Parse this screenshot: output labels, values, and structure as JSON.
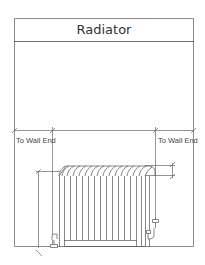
{
  "diagram": {
    "title": "Radiator",
    "labels": {
      "left_clearance": "To Wall End",
      "right_clearance": "To Wall End"
    },
    "colors": {
      "frame": "#8a8a8a",
      "line": "#555555",
      "text": "#333333"
    },
    "radiator": {
      "section_count": 14
    }
  }
}
